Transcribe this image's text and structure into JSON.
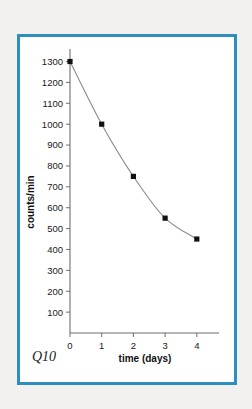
{
  "figure": {
    "corner_label": "Q10",
    "frame_color": "#2e8fbe",
    "background": "#ffffff",
    "page_background": "#f2f1ef"
  },
  "chart_data": {
    "type": "line",
    "title": "",
    "xlabel": "time (days)",
    "ylabel": "counts/min",
    "x": [
      0,
      1,
      2,
      3,
      4
    ],
    "values": [
      1300,
      1000,
      750,
      550,
      450
    ],
    "series": [
      {
        "name": "counts/min",
        "x": [
          0,
          1,
          2,
          3,
          4
        ],
        "values": [
          1300,
          1000,
          750,
          550,
          450
        ]
      }
    ],
    "xlim": [
      0,
      4.7
    ],
    "ylim": [
      0,
      1360
    ],
    "xticks": [
      0,
      1,
      2,
      3,
      4
    ],
    "xtick_labels": [
      "0",
      "1",
      "2",
      "3",
      "4"
    ],
    "yticks": [
      100,
      200,
      300,
      400,
      500,
      600,
      700,
      800,
      900,
      1000,
      1100,
      1200,
      1300
    ],
    "ytick_labels": [
      "100",
      "200",
      "300",
      "400",
      "500",
      "600",
      "700",
      "800",
      "900",
      "1000",
      "1100",
      "1200",
      "1300"
    ],
    "grid": false,
    "legend": false,
    "marker": "square",
    "marker_color": "#111111",
    "line_color": "#8a8a8a"
  }
}
